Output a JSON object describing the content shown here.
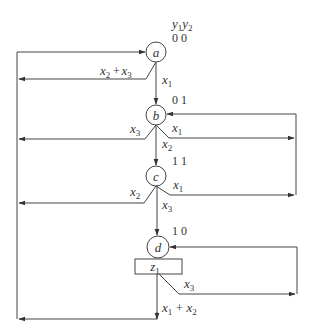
{
  "diagram": {
    "type": "ASM state diagram",
    "header_outputs": {
      "y1": "y",
      "y1_sub": "1",
      "y2": "y",
      "y2_sub": "2"
    },
    "states": [
      {
        "id": "a",
        "label": "a",
        "code": "0 0"
      },
      {
        "id": "b",
        "label": "b",
        "code": "0 1"
      },
      {
        "id": "c",
        "label": "c",
        "code": "1 1"
      },
      {
        "id": "d",
        "label": "d",
        "code": "1 0"
      }
    ],
    "output_box": {
      "state": "d",
      "var": "z",
      "sub": "1"
    },
    "transitions": [
      {
        "from": "a",
        "to": "a",
        "cond_parts": [
          [
            "x",
            "2"
          ],
          [
            " + ",
            ""
          ],
          [
            "x",
            "3"
          ]
        ]
      },
      {
        "from": "a",
        "to": "b",
        "cond_parts": [
          [
            "x",
            "1"
          ]
        ]
      },
      {
        "from": "b",
        "to": "a",
        "cond_parts": [
          [
            "x",
            "3"
          ]
        ]
      },
      {
        "from": "b",
        "to": "b",
        "cond_parts": [
          [
            "x",
            "1"
          ]
        ]
      },
      {
        "from": "b",
        "to": "c",
        "cond_parts": [
          [
            "x",
            "2"
          ]
        ]
      },
      {
        "from": "c",
        "to": "a",
        "cond_parts": [
          [
            "x",
            "2"
          ]
        ]
      },
      {
        "from": "c",
        "to": "b",
        "cond_parts": [
          [
            "x",
            "1"
          ]
        ]
      },
      {
        "from": "c",
        "to": "d",
        "cond_parts": [
          [
            "x",
            "3"
          ]
        ]
      },
      {
        "from": "d",
        "to": "d",
        "cond_parts": [
          [
            "x",
            "3"
          ]
        ]
      },
      {
        "from": "d",
        "to": "a",
        "cond_parts": [
          [
            "x",
            "1"
          ],
          [
            " + ",
            ""
          ],
          [
            "x",
            "2"
          ]
        ]
      }
    ],
    "labels": {
      "a_self": {
        "v1": "x",
        "s1": "2",
        "plus": "+",
        "v2": "x",
        "s2": "3"
      },
      "a_to_b": {
        "v": "x",
        "s": "1"
      },
      "b_to_a": {
        "v": "x",
        "s": "3"
      },
      "b_self": {
        "v": "x",
        "s": "1"
      },
      "b_to_c": {
        "v": "x",
        "s": "2"
      },
      "c_to_a": {
        "v": "x",
        "s": "2"
      },
      "c_to_b": {
        "v": "x",
        "s": "1"
      },
      "c_to_d": {
        "v": "x",
        "s": "3"
      },
      "d_self": {
        "v": "x",
        "s": "3"
      },
      "d_to_a": {
        "v1": "x",
        "s1": "1",
        "plus": "+",
        "v2": "x",
        "s2": "2"
      }
    },
    "colors": {
      "line": "#444444",
      "text": "#333333",
      "background": "#ffffff"
    }
  }
}
